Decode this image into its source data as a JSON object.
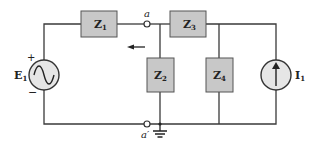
{
  "diagram": {
    "type": "circuit",
    "colors": {
      "wire": "#3a3a3a",
      "component_fill": "#c8c8c8",
      "component_stroke": "#555555"
    },
    "source_voltage": {
      "label": "E",
      "subscript": "1",
      "type": "ac-voltage-source",
      "plus": "+",
      "minus": "−"
    },
    "source_current": {
      "label": "I",
      "subscript": "1",
      "type": "current-source"
    },
    "impedances": [
      {
        "label": "Z",
        "subscript": "1"
      },
      {
        "label": "Z",
        "subscript": "2"
      },
      {
        "label": "Z",
        "subscript": "3"
      },
      {
        "label": "Z",
        "subscript": "4"
      }
    ],
    "nodes": [
      {
        "label": "a"
      },
      {
        "label": "a′"
      }
    ]
  }
}
